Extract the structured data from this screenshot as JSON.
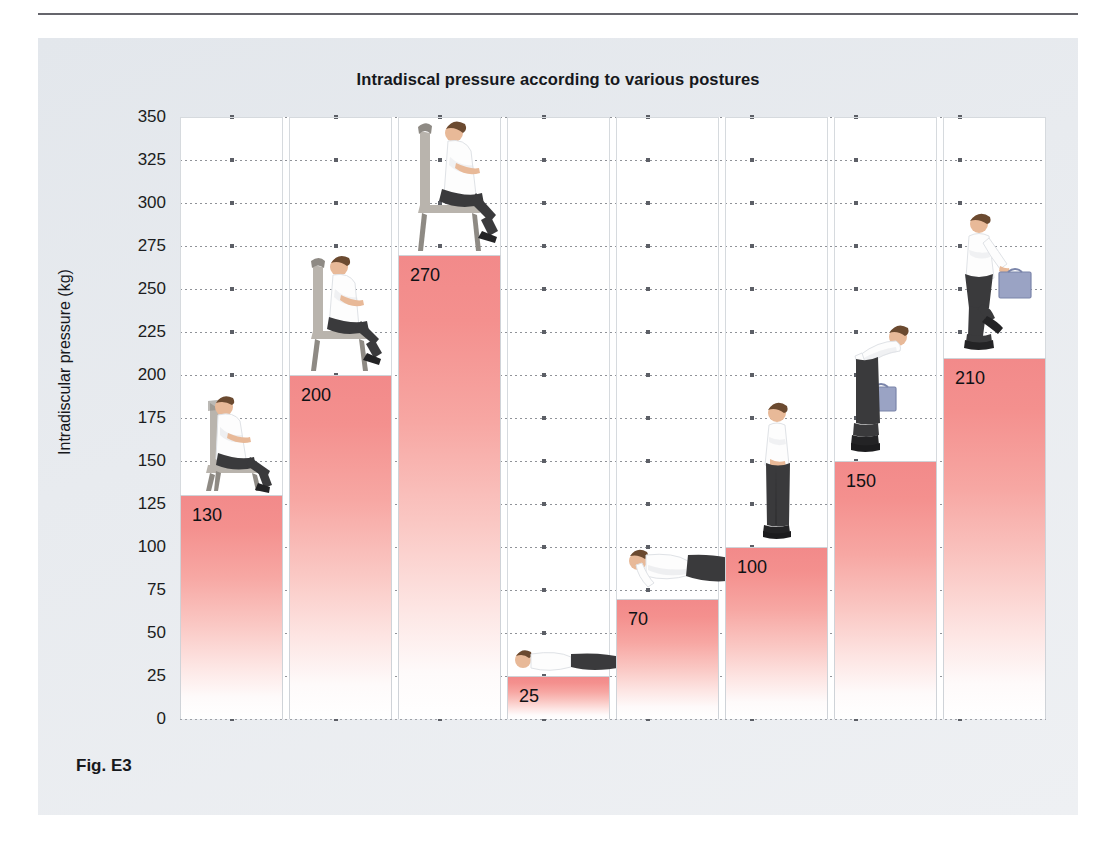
{
  "figure": {
    "caption": "Fig. E3",
    "cut_text": ""
  },
  "chart_data": {
    "type": "bar",
    "title": "Intradiscal pressure according to various postures",
    "xlabel": "",
    "ylabel": "Intradiscular pressure (kg)",
    "ylim": [
      0,
      350
    ],
    "ytick_step": 25,
    "grid": true,
    "legend": "none",
    "bar_color": "#f28a8a",
    "bar_gradient_to": "#ffffff",
    "yticks": [
      "350",
      "325",
      "300",
      "275",
      "250",
      "225",
      "200",
      "175",
      "150",
      "125",
      "100",
      "75",
      "50",
      "25",
      "0"
    ],
    "categories": [
      "sitting reclined",
      "sitting upright",
      "sitting leaning forward",
      "lying supine",
      "lying prone propped on elbows",
      "standing",
      "bending forward with briefcase",
      "walking carrying briefcase"
    ],
    "values": [
      130,
      200,
      270,
      25,
      70,
      100,
      150,
      210
    ],
    "labels": [
      "130",
      "200",
      "270",
      "25",
      "70",
      "100",
      "150",
      "210"
    ],
    "postures": [
      "sitting-reclined-icon",
      "sitting-upright-icon",
      "sitting-leaning-forward-icon",
      "lying-supine-icon",
      "lying-prone-propped-icon",
      "standing-icon",
      "bending-forward-briefcase-icon",
      "walking-briefcase-icon"
    ]
  }
}
